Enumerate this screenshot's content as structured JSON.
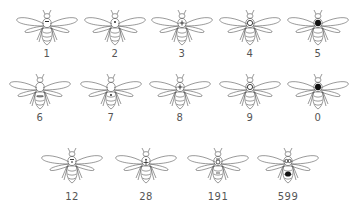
{
  "colors": {
    "ink": "#555555",
    "mark": "#111111",
    "background": "#ffffff"
  },
  "rows": [
    {
      "bees": [
        {
          "label": "1",
          "mark": "thorax-stripe",
          "cx": 47,
          "top": 6
        },
        {
          "label": "2",
          "mark": "thorax-dot-small",
          "cx": 115,
          "top": 6
        },
        {
          "label": "3",
          "mark": "thorax-cross",
          "cx": 182,
          "top": 6
        },
        {
          "label": "4",
          "mark": "thorax-ring",
          "cx": 250,
          "top": 6
        },
        {
          "label": "5",
          "mark": "thorax-solid",
          "cx": 318,
          "top": 6
        }
      ]
    },
    {
      "bees": [
        {
          "label": "6",
          "mark": "abdomen-stripe",
          "cx": 40,
          "top": 70
        },
        {
          "label": "7",
          "mark": "abdomen-dot-small",
          "cx": 111,
          "top": 70
        },
        {
          "label": "8",
          "mark": "thorax-cross-lower",
          "cx": 180,
          "top": 70
        },
        {
          "label": "9",
          "mark": "thorax-ring-lower",
          "cx": 250,
          "top": 70
        },
        {
          "label": "0",
          "mark": "thorax-solid-lower",
          "cx": 318,
          "top": 70
        }
      ]
    },
    {
      "bees": [
        {
          "label": "12",
          "mark": "combo-1-2",
          "cx": 72,
          "top": 144
        },
        {
          "label": "28",
          "mark": "combo-2-8",
          "cx": 146,
          "top": 144
        },
        {
          "label": "191",
          "mark": "combo-1-9-1",
          "cx": 218,
          "top": 144
        },
        {
          "label": "599",
          "mark": "combo-5-9-9",
          "cx": 288,
          "top": 144
        }
      ]
    }
  ],
  "label_tops": [
    48,
    112,
    191
  ]
}
